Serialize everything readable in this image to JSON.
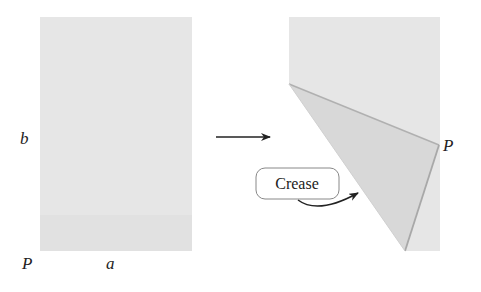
{
  "diagram": {
    "left_sheet": {
      "labels": {
        "b": "b",
        "p": "P",
        "a": "a"
      }
    },
    "right_sheet": {
      "labels": {
        "p": "P"
      },
      "callout": "Crease"
    },
    "colors": {
      "paper": "#e6e6e6",
      "folded_flap": "#d9d9d9",
      "edge": "#b5b5b5",
      "ink": "#222222"
    }
  }
}
